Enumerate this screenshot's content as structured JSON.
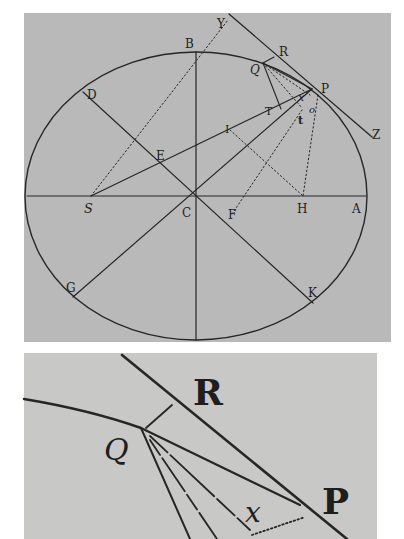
{
  "figure": {
    "upper_diagram": {
      "labels": {
        "B": "B",
        "Y": "Y",
        "R": "R",
        "Q": "Q",
        "P": "P",
        "D": "D",
        "T": "T",
        "x": "x",
        "t": "t",
        "o": "o",
        "I": "I",
        "Z": "Z",
        "E": "E",
        "S": "S",
        "C": "C",
        "F": "F",
        "H": "H",
        "A": "A",
        "G": "G",
        "K": "K"
      }
    },
    "lower_diagram": {
      "caption": "Enlarged detail near P",
      "labels": {
        "R": "R",
        "Q": "Q",
        "P": "P",
        "x": "x"
      }
    }
  }
}
